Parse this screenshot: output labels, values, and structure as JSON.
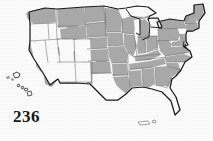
{
  "figure": {
    "type": "choropleth-map",
    "region": "United States",
    "page_number": "236",
    "colors": {
      "shaded_fill": "#a9a9a9",
      "unshaded_fill": "#fbfbfb",
      "state_border": "#6e6e6e",
      "outer_border": "#1a1a1a",
      "page_number_color": "#171717",
      "background": "#ffffff"
    },
    "insets": [
      {
        "name": "alaska",
        "shaded": false
      },
      {
        "name": "hawaii",
        "shaded": false
      },
      {
        "name": "puerto-rico",
        "shaded": false
      }
    ],
    "states": [
      {
        "code": "WA",
        "shaded": true
      },
      {
        "code": "OR",
        "shaded": false
      },
      {
        "code": "CA",
        "shaded": false
      },
      {
        "code": "NV",
        "shaded": false
      },
      {
        "code": "ID",
        "shaded": false
      },
      {
        "code": "MT",
        "shaded": true
      },
      {
        "code": "WY",
        "shaded": true
      },
      {
        "code": "UT",
        "shaded": false
      },
      {
        "code": "AZ",
        "shaded": false
      },
      {
        "code": "NM",
        "shaded": false
      },
      {
        "code": "CO",
        "shaded": false
      },
      {
        "code": "ND",
        "shaded": true
      },
      {
        "code": "SD",
        "shaded": true
      },
      {
        "code": "NE",
        "shaded": true
      },
      {
        "code": "KS",
        "shaded": true
      },
      {
        "code": "OK",
        "shaded": true
      },
      {
        "code": "TX",
        "shaded": false
      },
      {
        "code": "MN",
        "shaded": true
      },
      {
        "code": "IA",
        "shaded": true
      },
      {
        "code": "MO",
        "shaded": true
      },
      {
        "code": "AR",
        "shaded": true
      },
      {
        "code": "LA",
        "shaded": true
      },
      {
        "code": "WI",
        "shaded": true
      },
      {
        "code": "IL",
        "shaded": true
      },
      {
        "code": "MI",
        "shaded": true
      },
      {
        "code": "IN",
        "shaded": true
      },
      {
        "code": "OH",
        "shaded": true
      },
      {
        "code": "KY",
        "shaded": true
      },
      {
        "code": "TN",
        "shaded": true
      },
      {
        "code": "MS",
        "shaded": true
      },
      {
        "code": "AL",
        "shaded": true
      },
      {
        "code": "GA",
        "shaded": true
      },
      {
        "code": "FL",
        "shaded": false
      },
      {
        "code": "SC",
        "shaded": true
      },
      {
        "code": "NC",
        "shaded": true
      },
      {
        "code": "VA",
        "shaded": true
      },
      {
        "code": "WV",
        "shaded": true
      },
      {
        "code": "MD",
        "shaded": true
      },
      {
        "code": "DE",
        "shaded": true
      },
      {
        "code": "PA",
        "shaded": true
      },
      {
        "code": "NJ",
        "shaded": true
      },
      {
        "code": "NY",
        "shaded": true
      },
      {
        "code": "CT",
        "shaded": true
      },
      {
        "code": "RI",
        "shaded": true
      },
      {
        "code": "MA",
        "shaded": true
      },
      {
        "code": "VT",
        "shaded": true
      },
      {
        "code": "NH",
        "shaded": true
      },
      {
        "code": "ME",
        "shaded": true
      }
    ]
  }
}
